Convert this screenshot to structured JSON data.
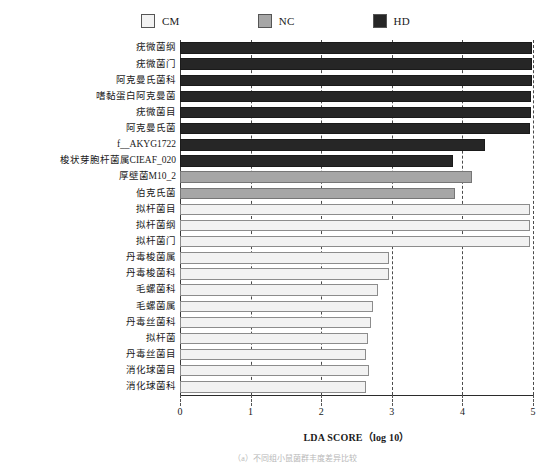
{
  "legend": {
    "items": [
      {
        "label": "CM",
        "color": "#f2f2f2",
        "swatch_name": "legend-swatch-cm"
      },
      {
        "label": "NC",
        "color": "#a6a6a6",
        "swatch_name": "legend-swatch-nc"
      },
      {
        "label": "HD",
        "color": "#262626",
        "swatch_name": "legend-swatch-hd"
      }
    ]
  },
  "axis": {
    "x_title": "LDA SCORE（log 10）",
    "x_ticks": [
      "0",
      "1",
      "2",
      "3",
      "4",
      "5"
    ],
    "x_min": 0,
    "x_max": 5,
    "grid": true,
    "grid_style": "dashed-vertical"
  },
  "caption": "（a）不同组小鼠菌群丰度差异比较",
  "chart_data": {
    "type": "bar",
    "orientation": "horizontal",
    "title": "",
    "xlabel": "LDA SCORE（log 10）",
    "ylabel": "",
    "xlim": [
      0,
      5
    ],
    "grid": true,
    "legend_position": "top-center",
    "group_colors": {
      "CM": "#f2f2f2",
      "NC": "#a6a6a6",
      "HD": "#262626"
    },
    "categories": [
      "疣微菌纲",
      "疣微菌门",
      "阿克曼氏菌科",
      "嗜黏蛋白阿克曼菌",
      "疣微菌目",
      "阿克曼氏菌",
      "f__AKYG1722",
      "梭状芽胞杆菌属CIEAF_020",
      "厚壁菌M10_2",
      "伯克氏菌",
      "拟杆菌目",
      "拟杆菌纲",
      "拟杆菌门",
      "丹毒梭菌属",
      "丹毒梭菌科",
      "毛螺菌科",
      "毛螺菌属",
      "丹毒丝菌科",
      "拟杆菌",
      "丹毒丝菌目",
      "消化球菌目",
      "消化球菌科"
    ],
    "groups": [
      "HD",
      "HD",
      "HD",
      "HD",
      "HD",
      "HD",
      "HD",
      "HD",
      "NC",
      "NC",
      "CM",
      "CM",
      "CM",
      "CM",
      "CM",
      "CM",
      "CM",
      "CM",
      "CM",
      "CM",
      "CM",
      "CM"
    ],
    "values": [
      4.98,
      4.98,
      4.98,
      4.97,
      4.97,
      4.96,
      4.32,
      3.87,
      4.13,
      3.9,
      4.96,
      4.96,
      4.96,
      2.96,
      2.96,
      2.8,
      2.74,
      2.7,
      2.66,
      2.64,
      2.67,
      2.64
    ]
  }
}
